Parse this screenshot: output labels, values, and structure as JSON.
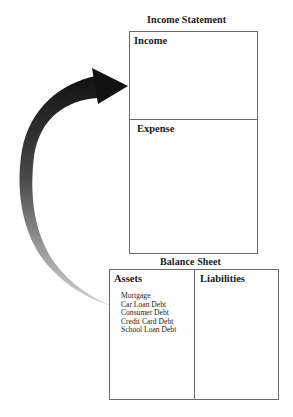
{
  "income_statement": {
    "title": "Income Statement",
    "sections": [
      {
        "label": "Income"
      },
      {
        "label": "Expense"
      }
    ]
  },
  "balance_sheet": {
    "title": "Balance Sheet",
    "columns": [
      {
        "label": "Assets",
        "items": [
          "Mortgage",
          "Car Loan Debt",
          "Consumer Debt",
          "Credit Card Debt",
          "School Loan Debt"
        ]
      },
      {
        "label": "Liabilities",
        "items": []
      }
    ]
  },
  "arrow": {
    "from": "balance_sheet.assets",
    "to": "income_statement.income",
    "color_dark": "#1a1a1a",
    "color_light": "#c8c8c8"
  }
}
